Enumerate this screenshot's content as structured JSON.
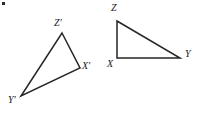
{
  "figure": {
    "type": "geometry-diagram",
    "background_color": "#ffffff",
    "stroke_color": "#262626",
    "stroke_width": 1.5,
    "label_color": "#1a1a1a",
    "canvas": {
      "width": 202,
      "height": 115
    },
    "shapes": [
      {
        "name": "triangle-image-primed",
        "vertices": [
          {
            "label": "Z'",
            "x": 62,
            "y": 33,
            "label_x": 54,
            "label_y": 18
          },
          {
            "label": "X'",
            "x": 80,
            "y": 68,
            "label_x": 82,
            "label_y": 61
          },
          {
            "label": "Y'",
            "x": 21,
            "y": 96,
            "label_x": 8,
            "label_y": 95
          }
        ]
      },
      {
        "name": "triangle-preimage-right",
        "vertices": [
          {
            "label": "Z",
            "x": 117,
            "y": 21,
            "label_x": 111,
            "label_y": 3
          },
          {
            "label": "X",
            "x": 117,
            "y": 58,
            "label_x": 107,
            "label_y": 59
          },
          {
            "label": "Y",
            "x": 180,
            "y": 58,
            "label_x": 185,
            "label_y": 49
          }
        ]
      }
    ],
    "stray_mark": {
      "name": "stray-dot",
      "x": 2,
      "y": 2,
      "size": 3,
      "color": "#2b2b2b"
    }
  }
}
